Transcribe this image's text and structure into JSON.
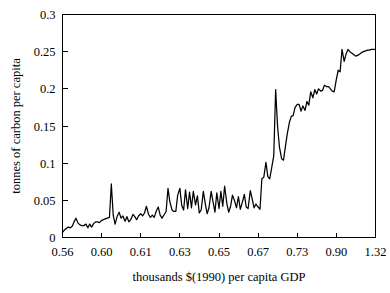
{
  "chart_data": {
    "type": "line",
    "title": "",
    "xlabel": "thousands $(1990) per capita GDP",
    "ylabel": "tonnes of carbon per capita",
    "grid": false,
    "legend": null,
    "ylim": [
      0,
      0.3
    ],
    "y_ticks": [
      "0",
      "0.05",
      "0.1",
      "0.15",
      "0.2",
      "0.25",
      "0.3"
    ],
    "y_tick_values": [
      0,
      0.05,
      0.1,
      0.15,
      0.2,
      0.25,
      0.3
    ],
    "x_ticks": [
      "0.56",
      "0.60",
      "0.61",
      "0.63",
      "0.65",
      "0.67",
      "0.73",
      "0.90",
      "1.32"
    ],
    "x_axis_note": "categorical / quantile spacing — ticks evenly spaced in pixels",
    "series": [
      {
        "name": "carbon per capita",
        "color": "#000000",
        "x": [
          0.0,
          0.6,
          1.2,
          1.8,
          2.5,
          3.1,
          3.7,
          4.3,
          5.0,
          5.6,
          6.2,
          6.8,
          7.5,
          8.1,
          8.7,
          9.3,
          10.0,
          10.6,
          11.2,
          11.8,
          12.5,
          13.1,
          13.7,
          14.3,
          15.0,
          15.6,
          16.2,
          16.8,
          17.5,
          18.1,
          18.7,
          19.3,
          20.0,
          20.6,
          21.2,
          21.8,
          22.5,
          23.1,
          23.7,
          24.3,
          25.0,
          25.6,
          26.2,
          26.8,
          27.5,
          28.1,
          28.7,
          29.3,
          30.0,
          30.6,
          31.2,
          31.8,
          32.5,
          33.1,
          33.7,
          34.3,
          35.0,
          35.6,
          36.2,
          36.8,
          37.5,
          38.1,
          38.7,
          39.3,
          40.0,
          40.6,
          41.2,
          41.8,
          42.5,
          43.1,
          43.7,
          44.3,
          45.0,
          45.6,
          46.2,
          46.8,
          47.5,
          48.1,
          48.7,
          49.3,
          50.0,
          50.6,
          51.2,
          51.8,
          52.5,
          53.1,
          53.7,
          54.3,
          55.0,
          55.6,
          56.2,
          56.8,
          57.5,
          58.1,
          58.7,
          59.3,
          60.0,
          60.6,
          61.2,
          61.8,
          62.5,
          63.1,
          63.7,
          64.3,
          65.0,
          65.6,
          66.2,
          66.8,
          67.5,
          68.1,
          68.7,
          69.3,
          70.0,
          70.6,
          71.2,
          71.8,
          72.5,
          73.1,
          73.7,
          74.3,
          75.0,
          75.6,
          76.2,
          76.8,
          77.5,
          78.1,
          78.7,
          79.3,
          80.0,
          80.6,
          81.2,
          81.8,
          82.5,
          83.1,
          83.7,
          84.3,
          85.0,
          85.6,
          86.2,
          86.8,
          87.5,
          88.1,
          88.7,
          89.3,
          90.0,
          90.6,
          91.2,
          91.8,
          92.5,
          93.1,
          93.7,
          94.3,
          95.0,
          95.6,
          96.2,
          96.8,
          97.5,
          98.1,
          98.7,
          99.3,
          100.0
        ],
        "values": [
          0.007,
          0.01,
          0.012,
          0.014,
          0.013,
          0.015,
          0.021,
          0.026,
          0.019,
          0.017,
          0.016,
          0.016,
          0.018,
          0.013,
          0.018,
          0.014,
          0.019,
          0.021,
          0.021,
          0.02,
          0.023,
          0.024,
          0.025,
          0.026,
          0.027,
          0.072,
          0.03,
          0.018,
          0.029,
          0.034,
          0.026,
          0.029,
          0.022,
          0.028,
          0.021,
          0.024,
          0.031,
          0.028,
          0.024,
          0.029,
          0.032,
          0.029,
          0.033,
          0.042,
          0.031,
          0.027,
          0.03,
          0.027,
          0.036,
          0.041,
          0.03,
          0.026,
          0.031,
          0.035,
          0.066,
          0.048,
          0.037,
          0.035,
          0.035,
          0.057,
          0.066,
          0.043,
          0.037,
          0.064,
          0.039,
          0.061,
          0.04,
          0.062,
          0.044,
          0.056,
          0.033,
          0.037,
          0.062,
          0.046,
          0.032,
          0.04,
          0.062,
          0.048,
          0.034,
          0.06,
          0.039,
          0.062,
          0.042,
          0.069,
          0.046,
          0.034,
          0.042,
          0.057,
          0.049,
          0.04,
          0.055,
          0.038,
          0.048,
          0.058,
          0.041,
          0.039,
          0.063,
          0.052,
          0.04,
          0.045,
          0.041,
          0.038,
          0.079,
          0.081,
          0.101,
          0.082,
          0.079,
          0.093,
          0.11,
          0.199,
          0.15,
          0.122,
          0.106,
          0.104,
          0.122,
          0.139,
          0.155,
          0.163,
          0.164,
          0.175,
          0.179,
          0.179,
          0.17,
          0.177,
          0.171,
          0.183,
          0.178,
          0.196,
          0.188,
          0.199,
          0.193,
          0.2,
          0.197,
          0.198,
          0.205,
          0.203,
          0.203,
          0.2,
          0.197,
          0.196,
          0.213,
          0.225,
          0.223,
          0.253,
          0.237,
          0.247,
          0.253,
          0.25,
          0.248,
          0.246,
          0.244,
          0.245,
          0.247,
          0.249,
          0.25,
          0.251,
          0.252,
          0.252,
          0.253,
          0.253,
          0.253
        ]
      }
    ]
  },
  "figure": {
    "background_color": "#ffffff",
    "line_color": "#000000",
    "axis_color": "#000000"
  }
}
